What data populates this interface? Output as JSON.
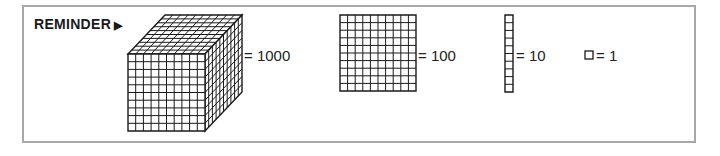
{
  "title": "REMINDER",
  "title_icon": "play-triangle-icon",
  "blocks": [
    {
      "name": "thousand-cube",
      "label": "= 1000",
      "value": 1000
    },
    {
      "name": "hundred-flat",
      "label": "= 100",
      "value": 100
    },
    {
      "name": "ten-rod",
      "label": "= 10",
      "value": 10
    },
    {
      "name": "unit-cube",
      "label": "= 1",
      "value": 1
    }
  ],
  "colors": {
    "border": "#a8a8a8",
    "ink": "#1a1a1a"
  }
}
